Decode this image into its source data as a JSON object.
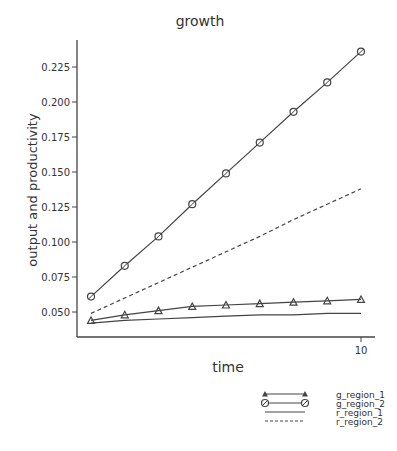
{
  "chart_data": {
    "type": "line",
    "title": "growth",
    "xlabel": "time",
    "ylabel": "output and productivity",
    "x": [
      2,
      3,
      4,
      5,
      6,
      7,
      8,
      9,
      10
    ],
    "x_tick_labels": [
      "10"
    ],
    "y_tick_labels": [
      "0.050",
      "0.075",
      "0.100",
      "0.125",
      "0.150",
      "0.175",
      "0.200",
      "0.225"
    ],
    "ylim": [
      0.035,
      0.245
    ],
    "xlim": [
      1.6,
      10.4
    ],
    "grid": false,
    "legend_position": "bottom-right",
    "series": [
      {
        "name": "g_region_1",
        "marker": "triangle",
        "style": "solid",
        "values": [
          0.044,
          0.048,
          0.051,
          0.054,
          0.055,
          0.056,
          0.057,
          0.058,
          0.059
        ]
      },
      {
        "name": "g_region_2",
        "marker": "circle",
        "style": "solid",
        "values": [
          0.061,
          0.083,
          0.104,
          0.127,
          0.149,
          0.171,
          0.193,
          0.214,
          0.236
        ]
      },
      {
        "name": "r_region_1",
        "marker": "none",
        "style": "solid",
        "values": [
          0.042,
          0.044,
          0.045,
          0.046,
          0.047,
          0.048,
          0.048,
          0.049,
          0.049
        ]
      },
      {
        "name": "r_region_2",
        "marker": "none",
        "style": "dashed",
        "values": [
          0.049,
          0.06,
          0.071,
          0.082,
          0.093,
          0.104,
          0.116,
          0.127,
          0.138
        ]
      }
    ]
  }
}
